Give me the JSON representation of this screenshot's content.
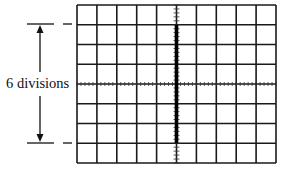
{
  "figure": {
    "kind": "oscilloscope-screen",
    "label": "6 divisions",
    "grid": {
      "columns": 10,
      "rows": 8,
      "left": 77,
      "top": 5,
      "width": 199,
      "height": 158,
      "line_color": "#1a1a1a"
    },
    "trace": {
      "orientation": "vertical",
      "column_index": 5,
      "from_row_line": 1,
      "to_row_line": 7,
      "span_divisions": 6,
      "color": "#000000"
    },
    "dimension_arrow": {
      "x": 40,
      "top_y": 24,
      "bottom_y": 143,
      "text": "6 divisions"
    }
  }
}
